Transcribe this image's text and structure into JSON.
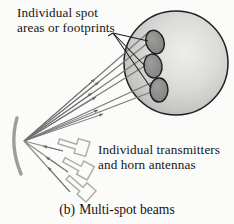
{
  "figure": {
    "caption_index": "(b)",
    "caption_text": "Multi-spot beams"
  },
  "labels": {
    "spots_line1": "Individual spot",
    "spots_line2": "areas or footprints",
    "transmitters_line1": "Individual transmitters",
    "transmitters_line2": "and horn antennas"
  },
  "colors": {
    "background": "#fbfbfa",
    "ink": "#161616",
    "line": "#6f6f6f",
    "sphere_outline": "#1c1c1c",
    "sphere_fill_light": "#e2e2e0",
    "sphere_fill_dark": "#b4b4b2",
    "spot_fill": "#8d8d8b",
    "reflector": "#9a9a98",
    "horn": "#b0b0ae"
  },
  "diagram": {
    "sphere": {
      "name": "earth-coverage-sphere",
      "cx": 176,
      "cy": 63,
      "r": 52
    },
    "spots": [
      {
        "name": "spot-beam-1",
        "cx": 155,
        "cy": 42,
        "rx": 9,
        "ry": 12,
        "rotate": -18
      },
      {
        "name": "spot-beam-2",
        "cx": 153,
        "cy": 66,
        "rx": 9,
        "ry": 12,
        "rotate": -10
      },
      {
        "name": "spot-beam-3",
        "cx": 158,
        "cy": 90,
        "rx": 9,
        "ry": 12,
        "rotate": -2
      }
    ],
    "focal_point": {
      "name": "reflector-focus",
      "x": 24,
      "y": 141
    },
    "reflector": {
      "name": "parabolic-reflector",
      "top": {
        "x": 18,
        "y": 120
      },
      "bottom": {
        "x": 22,
        "y": 172
      }
    },
    "beams": [
      {
        "name": "beam-ray-1",
        "x2": 148,
        "y2": 30
      },
      {
        "name": "beam-ray-2",
        "x2": 152,
        "y2": 37
      },
      {
        "name": "beam-ray-3",
        "x2": 146,
        "y2": 55
      },
      {
        "name": "beam-ray-4",
        "x2": 150,
        "y2": 62
      },
      {
        "name": "beam-ray-5",
        "x2": 152,
        "y2": 82
      },
      {
        "name": "beam-ray-6",
        "x2": 157,
        "y2": 89
      }
    ],
    "feed_rays": [
      {
        "name": "feed-ray-1",
        "x2": 62,
        "y2": 152
      },
      {
        "name": "feed-ray-2",
        "x2": 66,
        "y2": 172
      },
      {
        "name": "feed-ray-3",
        "x2": 68,
        "y2": 191
      }
    ],
    "horns": [
      {
        "name": "horn-antenna-1",
        "x": 57,
        "y": 140,
        "rotate": 18
      },
      {
        "name": "horn-antenna-2",
        "x": 61,
        "y": 161,
        "rotate": 30
      },
      {
        "name": "horn-antenna-3",
        "x": 62,
        "y": 180,
        "rotate": 42
      }
    ],
    "leaders": [
      {
        "name": "leader-line-to-spot-1",
        "x1": 112,
        "y1": 34,
        "x2": 147,
        "y2": 42
      },
      {
        "name": "leader-line-to-spot-2",
        "x1": 112,
        "y1": 34,
        "x2": 145,
        "y2": 66
      },
      {
        "name": "leader-line-to-spot-3",
        "x1": 112,
        "y1": 34,
        "x2": 150,
        "y2": 89
      }
    ]
  }
}
